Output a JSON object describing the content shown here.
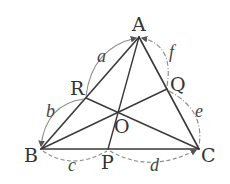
{
  "diagram": {
    "type": "geometry-triangle-cevians",
    "points": {
      "A": {
        "label": "A",
        "x": 139,
        "y": 37
      },
      "B": {
        "label": "B",
        "x": 41,
        "y": 149
      },
      "C": {
        "label": "C",
        "x": 199,
        "y": 149
      },
      "R": {
        "label": "R",
        "x": 86,
        "y": 98
      },
      "Q": {
        "label": "Q",
        "x": 167,
        "y": 89
      },
      "P": {
        "label": "P",
        "x": 108,
        "y": 149
      },
      "O": {
        "label": "O",
        "x": 118,
        "y": 112
      }
    },
    "segments": [
      "AB",
      "BC",
      "CA",
      "AP",
      "BQ",
      "CR"
    ],
    "arc_labels": {
      "a": "a",
      "b": "b",
      "c": "c",
      "d": "d",
      "e": "e",
      "f": "f"
    },
    "arcs": [
      {
        "id": "a",
        "from": "R",
        "to": "A",
        "style": "solid"
      },
      {
        "id": "b",
        "from": "R",
        "to": "B",
        "style": "solid"
      },
      {
        "id": "c",
        "from": "B",
        "to": "P",
        "style": "dashed"
      },
      {
        "id": "d",
        "from": "P",
        "to": "C",
        "style": "dashed"
      },
      {
        "id": "e",
        "from": "Q",
        "to": "C",
        "style": "dash-dot"
      },
      {
        "id": "f",
        "from": "Q",
        "to": "A",
        "style": "dash-dot"
      }
    ],
    "colors": {
      "lines": "#3a3a3a",
      "arcs": "#8a8a8a",
      "text": "#333333"
    }
  }
}
